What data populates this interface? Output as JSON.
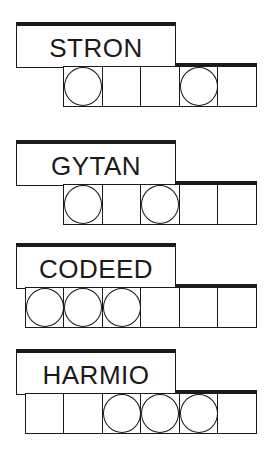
{
  "puzzles": [
    {
      "word": "STRON",
      "cell_count": 5,
      "circled": [
        true,
        false,
        false,
        true,
        false
      ],
      "top": 22
    },
    {
      "word": "GYTAN",
      "cell_count": 5,
      "circled": [
        true,
        false,
        true,
        false,
        false
      ],
      "top": 140
    },
    {
      "word": "CODEED",
      "cell_count": 6,
      "circled": [
        true,
        true,
        true,
        false,
        false,
        false
      ],
      "top": 243
    },
    {
      "word": "HARMIO",
      "cell_count": 6,
      "circled": [
        false,
        false,
        true,
        true,
        true,
        false
      ],
      "top": 349
    }
  ],
  "colors": {
    "ink": "#1a1a1a",
    "background": "#ffffff"
  }
}
